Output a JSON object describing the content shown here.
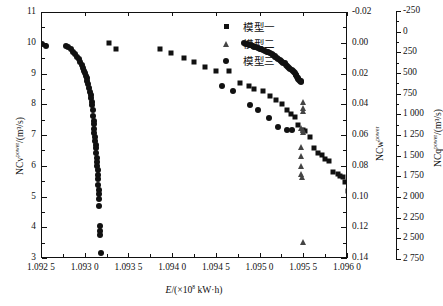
{
  "legend": {
    "position": "top-right",
    "entries": [
      {
        "label": "模型一",
        "marker": "square-marker",
        "color": "#111111"
      },
      {
        "label": "模型二",
        "marker": "triangle-marker",
        "color": "#444444"
      },
      {
        "label": "模型三",
        "marker": "circle-marker",
        "color": "#111111"
      }
    ]
  },
  "axes": {
    "x": {
      "title_main": "E",
      "title_unit": "/(×10",
      "title_exp": "8",
      "title_tail": " kW·h)",
      "ticks": [
        "1.092 5",
        "1.093 0",
        "1.093 5",
        "1.094 0",
        "1.094 5",
        "1.095 0",
        "1.095 5",
        "1.096 0"
      ],
      "min": 1.0925,
      "max": 1.096
    },
    "y_left": {
      "title_main": "NCv",
      "title_sup": "power",
      "title_tail": "/(m³/s)",
      "ticks": [
        "11",
        "10",
        "9",
        "8",
        "7",
        "6",
        "5",
        "4",
        "3"
      ],
      "min": 3,
      "max": 11
    },
    "y_right_inner": {
      "title_main": "NCw",
      "title_sup": "power",
      "ticks": [
        "-0.02",
        "0.00",
        "0.02",
        "0.04",
        "0.06",
        "0.08",
        "0.10",
        "0.12",
        "0.14"
      ],
      "min": -0.02,
      "max": 0.14
    },
    "y_right_outer": {
      "title_main": "NCq",
      "title_sup": "power",
      "title_tail": "/(m³/s)",
      "ticks": [
        "-250",
        "0",
        "250",
        "500",
        "750",
        "1 000",
        "1 250",
        "1 500",
        "1 750",
        "2 000",
        "2 250",
        "2 500",
        "2 750"
      ],
      "min": -250,
      "max": 2750
    }
  },
  "chart_data": {
    "type": "scatter",
    "title": "",
    "xlabel": "E/(×10⁸ kW·h)",
    "ylabel": "NCv^power/(m³/s)",
    "xlim": [
      1.0925,
      1.096
    ],
    "ylim": [
      3,
      11
    ],
    "grid": false,
    "legend_position": "top-right",
    "series": [
      {
        "name": "模型一",
        "marker": "square",
        "color": "#111111",
        "points": [
          [
            1.09327,
            10.02
          ],
          [
            1.09335,
            9.82
          ],
          [
            1.09385,
            9.83
          ],
          [
            1.09398,
            9.7
          ],
          [
            1.09412,
            9.53
          ],
          [
            1.09424,
            9.4
          ],
          [
            1.09437,
            9.25
          ],
          [
            1.09449,
            9.13
          ],
          [
            1.09464,
            9.1
          ],
          [
            1.09476,
            8.72
          ],
          [
            1.09487,
            8.62
          ],
          [
            1.09492,
            8.52
          ],
          [
            1.09503,
            8.47
          ],
          [
            1.09511,
            8.3
          ],
          [
            1.09518,
            8.18
          ],
          [
            1.09524,
            8.05
          ],
          [
            1.0953,
            7.86
          ],
          [
            1.09535,
            7.7
          ],
          [
            1.09539,
            7.62
          ],
          [
            1.09543,
            7.37
          ],
          [
            1.09548,
            7.21
          ],
          [
            1.09551,
            7.17
          ],
          [
            1.09556,
            6.96
          ],
          [
            1.09561,
            6.62
          ],
          [
            1.09566,
            6.44
          ],
          [
            1.0957,
            6.38
          ],
          [
            1.09574,
            6.26
          ],
          [
            1.09578,
            6.18
          ],
          [
            1.09583,
            5.84
          ],
          [
            1.09588,
            5.76
          ],
          [
            1.09591,
            5.7
          ],
          [
            1.09594,
            5.66
          ],
          [
            1.09597,
            5.5
          ],
          [
            1.096,
            5.2
          ],
          [
            1.09602,
            5.02
          ],
          [
            1.09604,
            4.88
          ],
          [
            1.09606,
            4.78
          ],
          [
            1.09608,
            4.58
          ],
          [
            1.09609,
            4.28
          ],
          [
            1.0961,
            4.12
          ],
          [
            1.09611,
            3.86
          ],
          [
            1.09612,
            3.68
          ],
          [
            1.09613,
            3.44
          ]
        ]
      },
      {
        "name": "模型二",
        "marker": "triangle",
        "color": "#444444",
        "points": [
          [
            1.09548,
            8.1
          ],
          [
            1.09548,
            7.9
          ],
          [
            1.09548,
            7.82
          ],
          [
            1.09546,
            7.25
          ],
          [
            1.09548,
            7.19
          ],
          [
            1.09549,
            7.13
          ],
          [
            1.09546,
            6.63
          ],
          [
            1.09546,
            6.34
          ],
          [
            1.09546,
            6.02
          ],
          [
            1.09546,
            5.78
          ],
          [
            1.09547,
            5.68
          ],
          [
            1.09548,
            3.54
          ]
        ]
      },
      {
        "name": "模型三",
        "marker": "circle",
        "color": "#111111",
        "points": [
          [
            1.0925,
            9.98
          ],
          [
            1.09255,
            9.93
          ],
          [
            1.09277,
            9.92
          ],
          [
            1.0928,
            9.88
          ],
          [
            1.09283,
            9.82
          ],
          [
            1.09285,
            9.74
          ],
          [
            1.09288,
            9.66
          ],
          [
            1.0929,
            9.58
          ],
          [
            1.09292,
            9.5
          ],
          [
            1.09294,
            9.42
          ],
          [
            1.09296,
            9.3
          ],
          [
            1.09297,
            9.22
          ],
          [
            1.09298,
            9.12
          ],
          [
            1.09299,
            9.04
          ],
          [
            1.093,
            8.96
          ],
          [
            1.09301,
            8.88
          ],
          [
            1.09302,
            8.78
          ],
          [
            1.09303,
            8.7
          ],
          [
            1.09304,
            8.56
          ],
          [
            1.09305,
            8.44
          ],
          [
            1.09306,
            8.34
          ],
          [
            1.09306,
            8.24
          ],
          [
            1.09307,
            8.12
          ],
          [
            1.09307,
            8.02
          ],
          [
            1.09308,
            7.86
          ],
          [
            1.09308,
            7.66
          ],
          [
            1.09309,
            7.5
          ],
          [
            1.09309,
            7.38
          ],
          [
            1.0931,
            7.24
          ],
          [
            1.0931,
            7.1
          ],
          [
            1.09311,
            6.96
          ],
          [
            1.09311,
            6.84
          ],
          [
            1.09312,
            6.72
          ],
          [
            1.09312,
            6.6
          ],
          [
            1.09312,
            6.46
          ],
          [
            1.09313,
            6.3
          ],
          [
            1.09313,
            6.16
          ],
          [
            1.09313,
            6.02
          ],
          [
            1.09314,
            5.88
          ],
          [
            1.09314,
            5.74
          ],
          [
            1.09314,
            5.6
          ],
          [
            1.09314,
            5.42
          ],
          [
            1.09315,
            5.26
          ],
          [
            1.09315,
            5.1
          ],
          [
            1.09315,
            4.94
          ],
          [
            1.09315,
            4.72
          ],
          [
            1.09316,
            4.08
          ],
          [
            1.09316,
            3.9
          ],
          [
            1.09316,
            3.78
          ],
          [
            1.09317,
            3.18
          ],
          [
            1.09456,
            8.62
          ],
          [
            1.09468,
            8.45
          ],
          [
            1.09488,
            8.02
          ],
          [
            1.09497,
            7.84
          ],
          [
            1.0951,
            7.58
          ],
          [
            1.0952,
            7.3
          ],
          [
            1.0953,
            7.2
          ],
          [
            1.09536,
            7.18
          ],
          [
            1.09481,
            10.02
          ],
          [
            1.09485,
            9.98
          ],
          [
            1.09489,
            9.95
          ],
          [
            1.09493,
            9.91
          ],
          [
            1.09497,
            9.87
          ],
          [
            1.09501,
            9.82
          ],
          [
            1.09505,
            9.77
          ],
          [
            1.09509,
            9.72
          ],
          [
            1.09513,
            9.66
          ],
          [
            1.09516,
            9.6
          ],
          [
            1.09519,
            9.54
          ],
          [
            1.09522,
            9.48
          ],
          [
            1.09525,
            9.42
          ],
          [
            1.09528,
            9.36
          ],
          [
            1.0953,
            9.29
          ],
          [
            1.09533,
            9.22
          ],
          [
            1.09536,
            9.15
          ],
          [
            1.09538,
            9.08
          ],
          [
            1.0954,
            9.0
          ],
          [
            1.09542,
            8.93
          ],
          [
            1.09543,
            8.86
          ],
          [
            1.09545,
            8.8
          ],
          [
            1.09546,
            8.76
          ],
          [
            1.09483,
            10.0
          ],
          [
            1.09487,
            9.96
          ],
          [
            1.09491,
            9.93
          ],
          [
            1.09495,
            9.89
          ],
          [
            1.09499,
            9.84
          ],
          [
            1.09503,
            9.79
          ],
          [
            1.09507,
            9.74
          ],
          [
            1.09511,
            9.69
          ],
          [
            1.09514,
            9.63
          ],
          [
            1.09517,
            9.57
          ],
          [
            1.0952,
            9.51
          ],
          [
            1.09523,
            9.45
          ],
          [
            1.09526,
            9.39
          ],
          [
            1.09529,
            9.32
          ],
          [
            1.09531,
            9.25
          ],
          [
            1.09534,
            9.19
          ],
          [
            1.09537,
            9.11
          ],
          [
            1.09539,
            9.04
          ],
          [
            1.09541,
            8.97
          ],
          [
            1.09543,
            8.9
          ],
          [
            1.09544,
            8.83
          ],
          [
            1.09546,
            8.78
          ]
        ]
      }
    ]
  }
}
